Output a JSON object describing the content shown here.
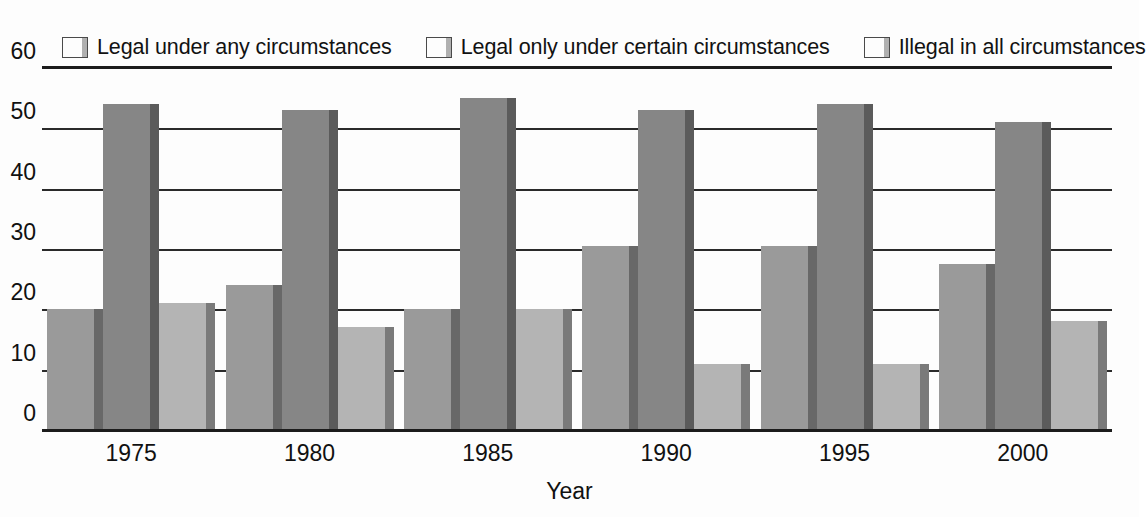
{
  "chart_data": {
    "type": "bar",
    "title": "",
    "subtitle": "",
    "xlabel": "Year",
    "ylabel": "",
    "categories": [
      "1975",
      "1980",
      "1985",
      "1990",
      "1995",
      "2000"
    ],
    "series": [
      {
        "name": "Legal under any circumstances",
        "color": "#9a9a9a",
        "values": [
          20,
          24,
          20,
          30.5,
          30.5,
          27.5
        ]
      },
      {
        "name": "Legal only under certain circumstances",
        "color": "#868686",
        "values": [
          54,
          53,
          55,
          53,
          54,
          51
        ]
      },
      {
        "name": "Illegal in all circumstances",
        "color": "#b4b4b4",
        "values": [
          21,
          17,
          20,
          11,
          11,
          18
        ]
      }
    ],
    "ylim": [
      0,
      60
    ],
    "yticks": [
      0,
      10,
      20,
      30,
      40,
      50,
      60
    ],
    "ytick_labels": [
      "0",
      "10",
      "20",
      "30",
      "40",
      "50",
      "60"
    ],
    "grid": true,
    "grid_axis": "y",
    "legend_position": "top",
    "annotations": []
  },
  "legend": {
    "entries": [
      {
        "label": "Legal under any circumstances",
        "swatch": "legend-swatch-series-1"
      },
      {
        "label": "Legal only under certain circumstances",
        "swatch": "legend-swatch-series-2"
      },
      {
        "label": "Illegal in all circumstances",
        "swatch": "legend-swatch-series-3"
      }
    ]
  },
  "axes": {
    "x_title": "Year",
    "x_tick_labels": [
      "1975",
      "1980",
      "1985",
      "1990",
      "1995",
      "2000"
    ],
    "y_tick_labels": [
      "60",
      "50",
      "40",
      "30",
      "20",
      "10",
      "0"
    ]
  },
  "colors": {
    "series_1": "#9a9a9a",
    "series_2": "#868686",
    "series_3": "#b4b4b4",
    "axis": "#1c1c1c",
    "grid": "#2a2a2a",
    "text": "#111111",
    "background": "#fdfdfd"
  }
}
